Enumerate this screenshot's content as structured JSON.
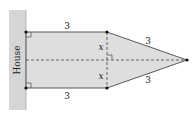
{
  "diagram": {
    "house_label": "House",
    "top_length": "3",
    "bottom_length": "3",
    "upper_slant": "3",
    "lower_slant": "3",
    "upper_half": "x",
    "lower_half": "x"
  },
  "colors": {
    "fill": "#dcdcdc",
    "wall": "#d4d4d4",
    "stroke": "#333333"
  }
}
